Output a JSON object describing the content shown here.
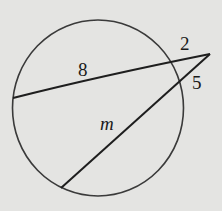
{
  "diagram": {
    "type": "circle-two-secants",
    "colors": {
      "background": "#e4e4e2",
      "stroke": "#2a2a2a"
    },
    "labels": {
      "secant1_internal": "8",
      "secant1_external": "2",
      "secant2_external": "5",
      "secant2_internal": "m"
    }
  }
}
